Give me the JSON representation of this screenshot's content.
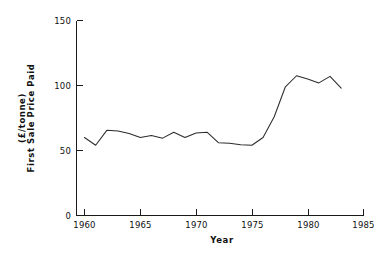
{
  "chart_data": {
    "type": "line",
    "title": "",
    "xlabel": "Year",
    "ylabel": "First  Sale  Price  Paid  (£/tonne)",
    "ylabel_main": "First  Sale  Price  Paid",
    "ylabel_unit": "(£/tonne)",
    "xlim": [
      1958.8,
      1986.2
    ],
    "ylim": [
      0,
      150
    ],
    "grid": false,
    "legend": false,
    "xticks": [
      1960,
      1965,
      1970,
      1975,
      1980,
      1985
    ],
    "xticklabels": [
      "1960",
      "1965",
      "1970",
      "1975",
      "1980",
      "1985"
    ],
    "yticks": [
      0,
      50,
      100,
      150
    ],
    "yticklabels": [
      "0",
      "50",
      "100",
      "150"
    ],
    "series": [
      {
        "name": "First Sale Price Paid",
        "x": [
          1960,
          1961,
          1962,
          1963,
          1964,
          1965,
          1966,
          1967,
          1968,
          1969,
          1970,
          1971,
          1972,
          1973,
          1974,
          1975,
          1976,
          1977,
          1978,
          1979,
          1980,
          1981,
          1982,
          1983
        ],
        "values": [
          60,
          54,
          65.5,
          65,
          63,
          60,
          61.5,
          59.5,
          64,
          60,
          63.5,
          64,
          56,
          55.5,
          54.5,
          54,
          60,
          76,
          99,
          107.5,
          105,
          102,
          107,
          98
        ]
      }
    ]
  },
  "axes": {
    "x_axis_label": "Year",
    "y_axis_label_line1": "(£/tonne)",
    "y_axis_label_line2": "First  Sale  Price  Paid"
  }
}
